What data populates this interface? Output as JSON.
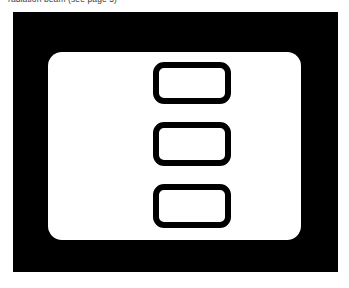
{
  "page": {
    "background_color": "#ffffff",
    "width": 349,
    "height": 288
  },
  "caption": {
    "text": "radiation beam (see page 5)",
    "color": "#3a3a3a",
    "note": "line of body text clipped by the top edge of the scan; only the lower few pixels of the glyphs are visible"
  },
  "figure": {
    "frame": {
      "label": "outer black rectangular frame",
      "fill_color": "#000000"
    },
    "panel": {
      "label": "white rounded display panel",
      "fill_color": "#ffffff"
    },
    "boxes": [
      {
        "label": "upper rounded rectangle outline",
        "border_color": "#000000",
        "fill_color": "#ffffff"
      },
      {
        "label": "middle rounded rectangle outline",
        "border_color": "#000000",
        "fill_color": "#ffffff"
      },
      {
        "label": "lower rounded rectangle outline",
        "border_color": "#000000",
        "fill_color": "#ffffff"
      }
    ]
  }
}
